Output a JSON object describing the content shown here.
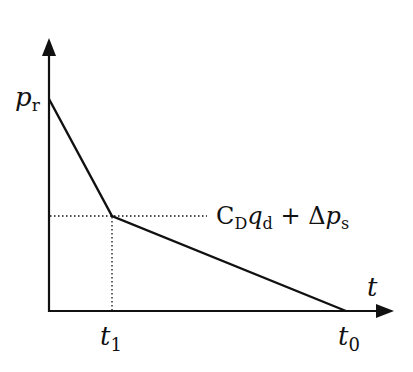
{
  "diagram": {
    "type": "pressure-time curve",
    "axes": {
      "y_label_main": "p",
      "y_label_sub": "r",
      "x_label": "t"
    },
    "ticks": {
      "t1_main": "t",
      "t1_sub": "1",
      "t0_main": "t",
      "t0_sub": "0"
    },
    "annotation": {
      "c": "C",
      "c_sub": "D",
      "q": "q",
      "q_sub": "d",
      "plus": " + ",
      "delta": "Δ",
      "p": "p",
      "p_sub": "s"
    },
    "points": [
      {
        "name": "p_r",
        "t": 0,
        "p": "p_r"
      },
      {
        "name": "knee",
        "t": "t_1",
        "p": "C_D q_d + Δp_s"
      },
      {
        "name": "end",
        "t": "t_0",
        "p": 0
      }
    ],
    "colors": {
      "line": "#111111",
      "background": "#ffffff"
    }
  }
}
